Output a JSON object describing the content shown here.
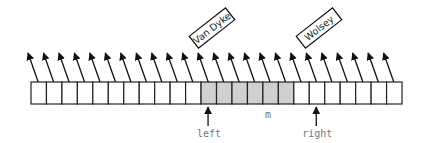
{
  "diagram": {
    "type": "array-with-pointers",
    "cell_count": 24,
    "array": {
      "x": 31,
      "y": 82,
      "cell_width": 15.46,
      "cell_height": 22
    },
    "shaded_range": {
      "start": 11,
      "end": 17
    },
    "colors": {
      "stroke": "#222222",
      "shaded_fill": "#d0d0d0",
      "cell_fill": "#ffffff",
      "label_text": "#777777"
    },
    "labels": [
      {
        "id": "van-dyke",
        "text": "Van Dyke",
        "cell_index": 11,
        "cx": 212,
        "cy": 28
      },
      {
        "id": "wolsey",
        "text": "Wolsey",
        "cell_index": 18,
        "cx": 319,
        "cy": 28
      }
    ],
    "pointers": [
      {
        "id": "left",
        "text": "left",
        "cell_index": 11
      },
      {
        "id": "right",
        "text": "right",
        "cell_index": 18
      }
    ],
    "middle_label": {
      "text": "m",
      "x": 268,
      "y": 118
    }
  }
}
